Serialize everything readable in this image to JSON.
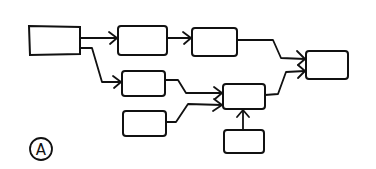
{
  "diagram": {
    "type": "flow-diagram",
    "style": "hand-drawn",
    "stroke_color": "#111111",
    "background": "#ffffff",
    "label": "A",
    "nodes": [
      {
        "id": "n1",
        "text": ""
      },
      {
        "id": "n2",
        "text": ""
      },
      {
        "id": "n3",
        "text": ""
      },
      {
        "id": "n4",
        "text": ""
      },
      {
        "id": "n5",
        "text": ""
      },
      {
        "id": "n6",
        "text": ""
      },
      {
        "id": "n7",
        "text": ""
      },
      {
        "id": "n8",
        "text": ""
      }
    ],
    "edges": [
      {
        "from": "n1",
        "to": "n2"
      },
      {
        "from": "n1",
        "to": "n5"
      },
      {
        "from": "n2",
        "to": "n3"
      },
      {
        "from": "n3",
        "to": "n4"
      },
      {
        "from": "n5",
        "to": "n7"
      },
      {
        "from": "n6",
        "to": "n7"
      },
      {
        "from": "n8",
        "to": "n7"
      },
      {
        "from": "n7",
        "to": "n4"
      }
    ]
  }
}
